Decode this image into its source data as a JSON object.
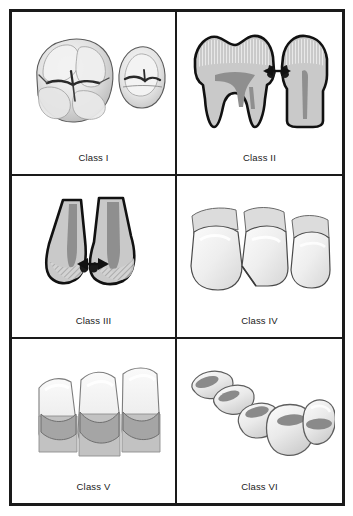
{
  "figure": {
    "layout": {
      "columns": 2,
      "rows": 3
    },
    "frame_color": "#1a1a1a",
    "background_color": "#ffffff"
  },
  "palette": {
    "outline": "#1a1a1a",
    "enamel_light": "#f0f0f0",
    "enamel_mid": "#d9d9d9",
    "dentin_gray": "#bfbfbf",
    "pulp_dark": "#8c8c8c",
    "lesion_dark": "#6e6e6e",
    "label_text": "#1a1a1a"
  },
  "cells": [
    {
      "id": "class-1",
      "label": "Class I",
      "icon": "molar-occlusal-pair-icon",
      "description": "Occlusal view of a molar and premolar with pit and fissure caries"
    },
    {
      "id": "class-2",
      "label": "Class II",
      "icon": "molar-premolar-cross-section-icon",
      "description": "Cross section of molar and premolar with proximal lesions and arrows"
    },
    {
      "id": "class-3",
      "label": "Class III",
      "icon": "anterior-pair-cross-section-icon",
      "description": "Cross section of two anterior teeth with proximal lesions and arrows"
    },
    {
      "id": "class-4",
      "label": "Class IV",
      "icon": "anterior-incisal-fracture-icon",
      "description": "Three anterior teeth, middle one with incisal angle involvement"
    },
    {
      "id": "class-5",
      "label": "Class V",
      "icon": "cervical-lesion-trio-icon",
      "description": "Three anterior teeth with cervical third lesions"
    },
    {
      "id": "class-6",
      "label": "Class VI",
      "icon": "incisal-cusp-tip-arch-icon",
      "description": "Arch of teeth with incisal edge and cusp tip lesions"
    }
  ]
}
